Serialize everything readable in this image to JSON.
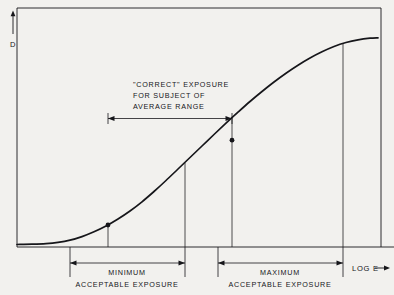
{
  "figure": {
    "background_color": "#f2f1ee",
    "ink_color": "#16161a",
    "curve_color": "#16161a"
  },
  "axes": {
    "y_label": "D",
    "y_arrow": "up-arrow",
    "x_label": "LOG E",
    "x_arrow": "right-arrow",
    "frame": {
      "left": 17,
      "top": 8,
      "right": 381,
      "bottom": 247
    }
  },
  "annotations": {
    "correct_exposure": {
      "line1": "\"CORRECT\" EXPOSURE",
      "line2": "FOR SUBJECT OF",
      "line3": "AVERAGE RANGE"
    },
    "minimum_exposure": {
      "line1": "MINIMUM",
      "line2": "ACCEPTABLE EXPOSURE"
    },
    "maximum_exposure": {
      "line1": "MAXIMUM",
      "line2": "ACCEPTABLE EXPOSURE"
    }
  },
  "chart_data": {
    "type": "line",
    "title": "",
    "xlabel": "LOG E",
    "ylabel": "D",
    "grid": false,
    "legend": "none",
    "xlim": [
      0,
      1
    ],
    "ylim": [
      0,
      1
    ],
    "series": [
      {
        "name": "Characteristic curve (H&D curve)",
        "description": "S-shaped film density curve with toe, straight-line portion and shoulder",
        "points": [
          [
            17,
            244.5
          ],
          [
            32,
            244.2
          ],
          [
            46,
            243.6
          ],
          [
            58,
            242.4
          ],
          [
            70,
            240.2
          ],
          [
            82,
            236.6
          ],
          [
            94,
            231.8
          ],
          [
            106,
            226.0
          ],
          [
            118,
            219.0
          ],
          [
            130,
            211.0
          ],
          [
            142,
            201.8
          ],
          [
            154,
            191.5
          ],
          [
            166,
            180.5
          ],
          [
            178,
            169.0
          ],
          [
            190,
            157.5
          ],
          [
            202,
            146.0
          ],
          [
            214,
            134.5
          ],
          [
            226,
            123.2
          ],
          [
            238,
            112.2
          ],
          [
            250,
            101.5
          ],
          [
            262,
            91.5
          ],
          [
            274,
            82.0
          ],
          [
            286,
            73.2
          ],
          [
            298,
            65.2
          ],
          [
            310,
            58.0
          ],
          [
            322,
            51.8
          ],
          [
            334,
            46.5
          ],
          [
            346,
            42.5
          ],
          [
            358,
            39.8
          ],
          [
            370,
            38.2
          ],
          [
            378,
            37.8
          ]
        ]
      }
    ],
    "markers": [
      {
        "name": "minimum-useful-density-point",
        "x": 108,
        "y": 225.0
      },
      {
        "name": "maximum-useful-density-point",
        "x": 232,
        "y": 140.2
      }
    ],
    "vertical_droplines": [
      {
        "name": "min-exposure-dropline",
        "x": 108,
        "y_top": 225.0,
        "y_bottom": 247
      },
      {
        "name": "correct-exposure-right-dropline",
        "x": 185,
        "y_top": 163.0,
        "y_bottom": 247
      },
      {
        "name": "max-exposure-dropline",
        "x": 232,
        "y_top": 117.0,
        "y_bottom": 247
      },
      {
        "name": "shoulder-dropline",
        "x": 343,
        "y_top": 43.5,
        "y_bottom": 247
      }
    ],
    "range_arrows": [
      {
        "name": "correct-exposure-range",
        "x_start": 108,
        "x_end": 232,
        "y": 115,
        "label": "\"CORRECT\" EXPOSURE FOR SUBJECT OF AVERAGE RANGE"
      },
      {
        "name": "minimum-acceptable-exposure-range",
        "x_start": 70,
        "x_end": 185,
        "y": 263,
        "label": "MINIMUM ACCEPTABLE EXPOSURE"
      },
      {
        "name": "maximum-acceptable-exposure-range",
        "x_start": 218,
        "x_end": 343,
        "y": 263,
        "label": "MAXIMUM ACCEPTABLE EXPOSURE"
      }
    ]
  }
}
